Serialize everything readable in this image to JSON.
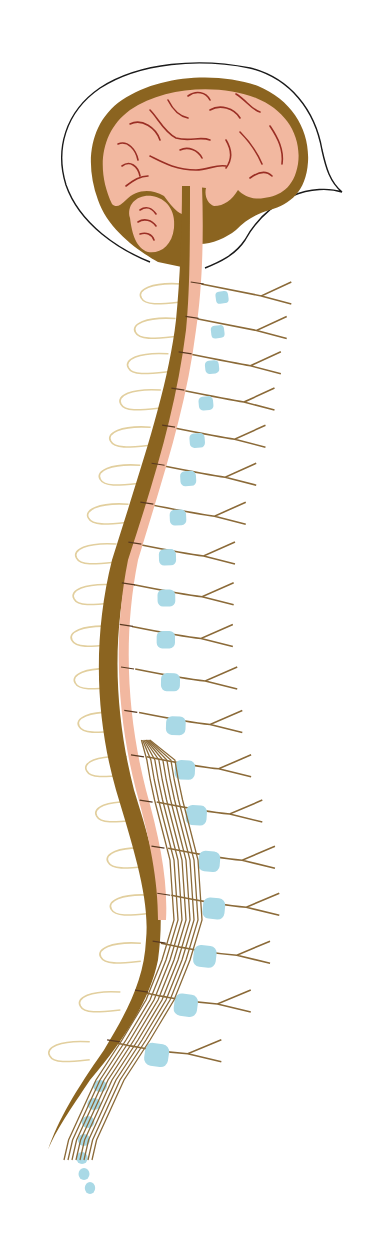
{
  "figure": {
    "title": "Central nervous system: brain and spinal cord with spinal nerves (sagittal view)",
    "labels": [],
    "colors": {
      "background": "#ffffff",
      "head_outline": "#1a1a1a",
      "brain_tissue": "#f2b8a0",
      "sulci": "#9a2e24",
      "dura_membrane": "#8b6420",
      "vertebrae": "#a9d9e6",
      "nerves": "#8b6a38",
      "dorsal_loops": "#e2cf9e"
    },
    "parts": [
      {
        "name": "skull-outline"
      },
      {
        "name": "cerebrum"
      },
      {
        "name": "cerebellum"
      },
      {
        "name": "brainstem"
      },
      {
        "name": "spinal-cord"
      },
      {
        "name": "vertebral-bodies",
        "count": 24
      },
      {
        "name": "spinal-nerves",
        "count": 31
      },
      {
        "name": "cauda-equina"
      },
      {
        "name": "coccygeal-segments",
        "count": 5
      }
    ]
  }
}
